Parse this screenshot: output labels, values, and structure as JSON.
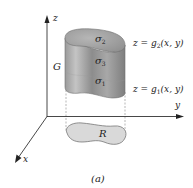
{
  "figure": {
    "caption": "(a)",
    "axes": {
      "x_label": "x",
      "y_label": "y",
      "z_label": "z"
    },
    "solid": {
      "label": "G",
      "surfaces": {
        "top": {
          "name": "σ",
          "sub": "2"
        },
        "side": {
          "name": "σ",
          "sub": "3"
        },
        "bottom": {
          "name": "σ",
          "sub": "1"
        }
      }
    },
    "equations": {
      "upper": {
        "prefix": "z = g",
        "sub": "2",
        "suffix": "(x, y)"
      },
      "lower": {
        "prefix": "z = g",
        "sub": "1",
        "suffix": "(x, y)"
      }
    },
    "region": {
      "label": "R"
    },
    "colors": {
      "solid_side": "#8f8f8f",
      "solid_top": "#a5a5a5",
      "region_fill": "#d9d9d9",
      "axis": "#333333"
    }
  }
}
